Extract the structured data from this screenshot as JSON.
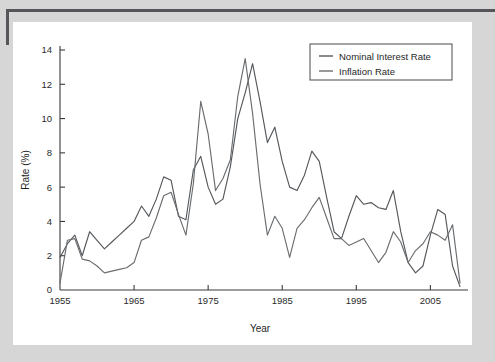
{
  "figure": {
    "background_color": "#ffffff",
    "page_color": "#d6d6d6",
    "edge_color": "#55565a"
  },
  "chart_data": {
    "type": "line",
    "title": "",
    "xlabel": "Year",
    "ylabel": "Rate (%)",
    "xlim": [
      1955,
      2009
    ],
    "ylim": [
      0,
      14
    ],
    "xticks": [
      1955,
      1965,
      1975,
      1985,
      1995,
      2005
    ],
    "xtick_labels": [
      "1955",
      "1965",
      "1975",
      "1985",
      "1995",
      "2005"
    ],
    "yticks": [
      0,
      2,
      4,
      6,
      8,
      10,
      12,
      14
    ],
    "ytick_labels": [
      "0",
      "2",
      "4",
      "6",
      "8",
      "10",
      "12",
      "14"
    ],
    "grid": false,
    "legend_position": "top-right",
    "x": [
      1955,
      1956,
      1957,
      1958,
      1959,
      1960,
      1961,
      1962,
      1963,
      1964,
      1965,
      1966,
      1967,
      1968,
      1969,
      1970,
      1971,
      1972,
      1973,
      1974,
      1975,
      1976,
      1977,
      1978,
      1979,
      1980,
      1981,
      1982,
      1983,
      1984,
      1985,
      1986,
      1987,
      1988,
      1989,
      1990,
      1991,
      1992,
      1993,
      1994,
      1995,
      1996,
      1997,
      1998,
      1999,
      2000,
      2001,
      2002,
      2003,
      2004,
      2005,
      2006,
      2007,
      2008,
      2009
    ],
    "series": [
      {
        "name": "Nominal Interest Rate",
        "color": "#55585c",
        "values": [
          1.9,
          2.7,
          3.2,
          2.0,
          3.4,
          2.9,
          2.4,
          2.8,
          3.2,
          3.6,
          4.0,
          4.9,
          4.3,
          5.3,
          6.6,
          6.4,
          4.3,
          4.1,
          7.0,
          7.8,
          6.0,
          5.0,
          5.3,
          7.2,
          10.0,
          11.5,
          13.2,
          11.0,
          8.6,
          9.5,
          7.5,
          6.0,
          5.8,
          6.7,
          8.1,
          7.5,
          5.4,
          3.4,
          3.0,
          4.3,
          5.5,
          5.0,
          5.1,
          4.8,
          4.7,
          5.8,
          3.4,
          1.6,
          1.0,
          1.4,
          3.2,
          4.7,
          4.4,
          1.4,
          0.2
        ]
      },
      {
        "name": "Inflation Rate",
        "color": "#6a6d70",
        "values": [
          0.4,
          2.9,
          3.0,
          1.8,
          1.7,
          1.4,
          1.0,
          1.1,
          1.2,
          1.3,
          1.6,
          2.9,
          3.1,
          4.2,
          5.5,
          5.7,
          4.4,
          3.2,
          6.2,
          11.0,
          9.1,
          5.8,
          6.5,
          7.6,
          11.3,
          13.5,
          10.3,
          6.2,
          3.2,
          4.3,
          3.6,
          1.9,
          3.6,
          4.1,
          4.8,
          5.4,
          4.2,
          3.0,
          3.0,
          2.6,
          2.8,
          3.0,
          2.3,
          1.6,
          2.2,
          3.4,
          2.8,
          1.6,
          2.3,
          2.7,
          3.4,
          3.2,
          2.9,
          3.8,
          0.4
        ]
      }
    ]
  },
  "legend": {
    "entries": [
      {
        "label": "Nominal Interest Rate"
      },
      {
        "label": "Inflation Rate"
      }
    ]
  }
}
